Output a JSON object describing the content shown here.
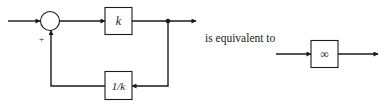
{
  "diagram": {
    "colors": {
      "stroke": "#1a1a1a",
      "background": "#ffffff"
    },
    "feedback_system": {
      "summing_junction": {
        "sign": "+"
      },
      "forward_block": {
        "label": "k"
      },
      "feedback_block": {
        "label": "1/k"
      }
    },
    "equivalence_text": "is equivalent to",
    "equivalent_system": {
      "block": {
        "label": "∞"
      }
    }
  }
}
